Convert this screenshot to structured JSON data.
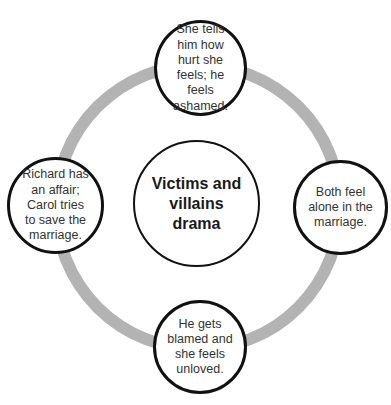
{
  "diagram": {
    "type": "cycle",
    "ring_color": "#b3b3b3",
    "border_color": "#111111",
    "center": {
      "label": "Victims and\nvillains\ndrama"
    },
    "nodes": [
      {
        "position": "top",
        "label": "She tells\nhim how\nhurt she\nfeels; he\nfeels\nashamed."
      },
      {
        "position": "right",
        "label": "Both feel\nalone in the\nmarriage."
      },
      {
        "position": "bottom",
        "label": "He gets\nblamed and\nshe feels\nunloved."
      },
      {
        "position": "left",
        "label": "Richard has\nan affair;\nCarol tries\nto save the\nmarriage."
      }
    ]
  }
}
